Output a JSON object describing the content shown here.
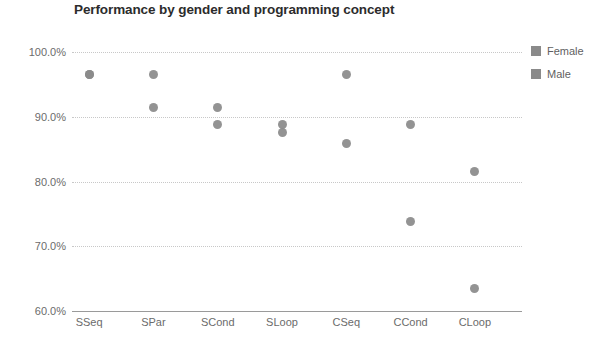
{
  "chart_data": {
    "type": "scatter",
    "title": "Performance by gender and programming concept",
    "xlabel": "",
    "ylabel": "",
    "grid": true,
    "legend_position": "right",
    "categories": [
      "SSeq",
      "SPar",
      "SCond",
      "SLoop",
      "CSeq",
      "CCond",
      "CLoop"
    ],
    "ylim": [
      60,
      100
    ],
    "ytick_values": [
      100,
      90,
      80,
      70,
      60
    ],
    "ytick_labels": [
      "100.0%",
      "90.0%",
      "80.0%",
      "70.0%",
      "60.0%"
    ],
    "series": [
      {
        "name": "Female",
        "color": "#8a8a8a",
        "values": [
          96.5,
          96.5,
          91.5,
          88.8,
          96.5,
          88.8,
          81.5
        ]
      },
      {
        "name": "Male",
        "color": "#8a8a8a",
        "values": [
          96.5,
          91.5,
          88.8,
          87.6,
          85.8,
          73.8,
          63.5
        ]
      }
    ]
  },
  "legend": {
    "items": [
      {
        "label": "Female",
        "swatch": "#8a8a8a"
      },
      {
        "label": "Male",
        "swatch": "#8a8a8a"
      }
    ]
  }
}
